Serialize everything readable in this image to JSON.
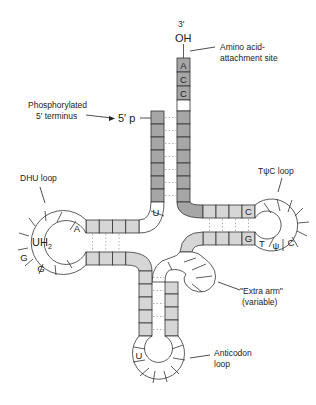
{
  "diagram": {
    "colors": {
      "stem_dark": "#a6a6a6",
      "stem_light": "#d6d6d6",
      "outline": "#333333",
      "pairing": "#b0b0b0"
    },
    "labels": {
      "three_prime": "3′",
      "oh": "OH",
      "amino_acid_line1": "Amino acid-",
      "amino_acid_line2": "attachment site",
      "phospho_line1": "Phosphorylated",
      "phospho_line2": "5′ terminus",
      "five_prime_p": "5′ p",
      "dhu_loop": "DHU loop",
      "tpsic_loop": "TψC loop",
      "extra_arm_line1": "\"Extra arm\"",
      "extra_arm_line2": "(variable)",
      "anticodon_line1": "Anticodon",
      "anticodon_line2": "loop",
      "uh2": "UH",
      "uh2_sub": "2"
    },
    "acceptor_end_bases": [
      "A",
      "C",
      "C"
    ],
    "bases": {
      "acceptor_U": "U",
      "dhu_A": "A",
      "dhu_G1": "G",
      "dhu_G2": "G",
      "tpsic_C": "C",
      "tpsic_G": "G",
      "loop_T": "T",
      "loop_psi": "ψ",
      "loop_C": "C",
      "anticodon_U": "U"
    }
  }
}
